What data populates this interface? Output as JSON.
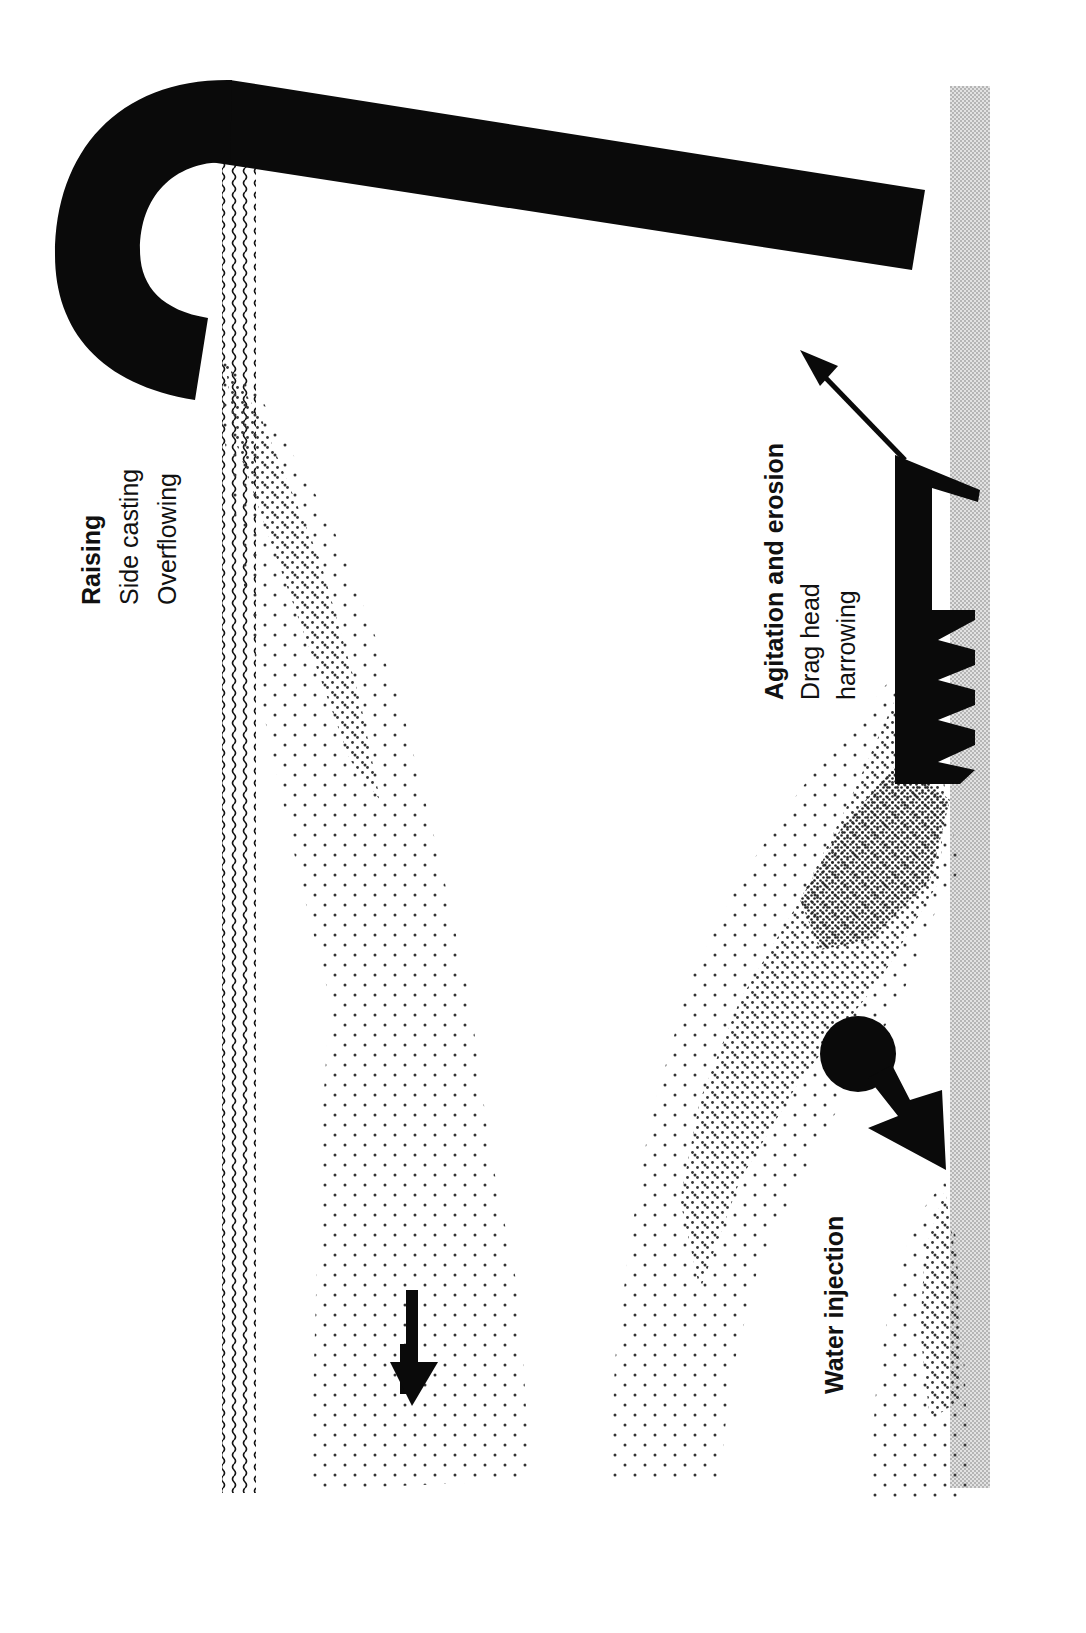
{
  "diagram": {
    "orientation": "rotated 90 degrees counter-clockwise",
    "colors": {
      "ink": "#0a0a0a",
      "seabed_strip": "#c8c8c8",
      "plume_dot": "#333333",
      "background": "#ffffff"
    },
    "labels": {
      "raising": {
        "heading": "Raising",
        "line1": "Side casting",
        "line2": "Overflowing"
      },
      "agitation": {
        "heading": "Agitation and erosion",
        "line1": "Drag head",
        "line2": "harrowing"
      },
      "water_injection": {
        "heading": "Water injection"
      }
    },
    "elements": [
      {
        "name": "water-surface",
        "pattern": "wavy-lines"
      },
      {
        "name": "seabed",
        "pattern": "fine-halftone-gray"
      },
      {
        "name": "discharge-pipe",
        "shape": "hooked pipe"
      },
      {
        "name": "surface-plume",
        "pattern": "halftone-dots"
      },
      {
        "name": "drag-head",
        "shape": "toothed head with arm"
      },
      {
        "name": "near-bed-plume",
        "pattern": "halftone-dots, dense core"
      },
      {
        "name": "water-injection-jet",
        "shape": "circle with arrow"
      },
      {
        "name": "injection-plume",
        "pattern": "halftone-dots"
      },
      {
        "name": "settling-arrow",
        "direction": "down-gradient"
      },
      {
        "name": "dredge-movement-arrow",
        "direction": "up-left"
      }
    ]
  }
}
